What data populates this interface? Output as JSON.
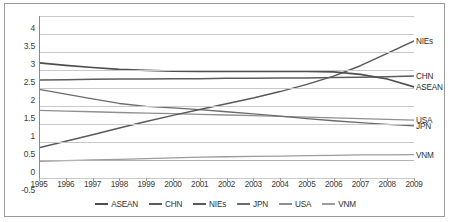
{
  "chart_data": {
    "type": "line",
    "title": "",
    "subtitle": "",
    "xlabel": "",
    "ylabel": "",
    "x": [
      1995,
      1996,
      1997,
      1998,
      1999,
      2000,
      2001,
      2002,
      2003,
      2004,
      2005,
      2006,
      2007,
      2008,
      2009
    ],
    "xtick_labels": [
      "1995",
      "1996",
      "1997",
      "1998",
      "1999",
      "2000",
      "2001",
      "2002",
      "2003",
      "2004",
      "2005",
      "2006",
      "2007",
      "2008",
      "2009"
    ],
    "ytick_labels": [
      "-0.5",
      "0",
      "0.5",
      "1",
      "1.5",
      "2",
      "2.5",
      "3",
      "3.5",
      "4"
    ],
    "yticks": [
      -0.5,
      0,
      0.5,
      1,
      1.5,
      2,
      2.5,
      3,
      3.5,
      4
    ],
    "ylim": [
      -0.5,
      4
    ],
    "xlim": [
      1995,
      2009
    ],
    "grid": true,
    "legend_position": "bottom",
    "series": [
      {
        "name": "ASEAN",
        "color": "#6f6f6f",
        "end_label": "ASEAN",
        "values": [
          1.96,
          1.88,
          1.79,
          1.71,
          1.63,
          1.55,
          1.62,
          1.69,
          1.76,
          1.83,
          1.89,
          1.94,
          1.98,
          2.0,
          2.02
        ]
      },
      {
        "name": "CHN",
        "color": "#5e5e5e",
        "end_label": "CHN",
        "values": [
          2.22,
          2.23,
          2.24,
          2.25,
          2.26,
          2.27,
          2.27,
          2.28,
          2.28,
          2.29,
          2.29,
          2.3,
          2.31,
          2.32,
          2.33
        ]
      },
      {
        "name": "NIEs",
        "color": "#4a4a4a",
        "end_label": "NIEs",
        "values": [
          2.7,
          2.64,
          2.58,
          2.53,
          2.5,
          2.48,
          2.47,
          2.48,
          2.5,
          2.55,
          2.64,
          2.78,
          2.95,
          3.14,
          3.31
        ]
      },
      {
        "name": "JPN",
        "color": "#7a7a7a",
        "end_label": "JPN",
        "values": [
          1.38,
          1.35,
          1.32,
          1.29,
          1.26,
          1.23,
          1.21,
          1.18,
          1.15,
          1.12,
          1.09,
          1.06,
          1.02,
          0.98,
          0.95
        ]
      },
      {
        "name": "USA",
        "color": "#8c8c8c",
        "end_label": "USA",
        "values": [
          2.7,
          2.64,
          2.58,
          2.53,
          2.5,
          2.48,
          2.47,
          2.48,
          2.5,
          2.55,
          2.64,
          2.78,
          2.95,
          3.14,
          3.31
        ]
      },
      {
        "name": "VNM",
        "color": "#9a9a9a",
        "end_label": "VNM",
        "values": [
          -0.04,
          -0.02,
          0.0,
          0.02,
          0.04,
          0.06,
          0.08,
          0.09,
          0.1,
          0.11,
          0.12,
          0.13,
          0.14,
          0.145,
          0.15
        ]
      }
    ],
    "series_render": [
      {
        "name": "VNM",
        "color": "#9c9c9c",
        "width": 1.3,
        "values": [
          -0.04,
          -0.02,
          0.0,
          0.02,
          0.04,
          0.06,
          0.08,
          0.09,
          0.1,
          0.11,
          0.12,
          0.13,
          0.14,
          0.145,
          0.15
        ]
      },
      {
        "name": "USA",
        "color": "#8f8f8f",
        "width": 1.3,
        "values": [
          1.38,
          1.36,
          1.34,
          1.32,
          1.3,
          1.29,
          1.27,
          1.25,
          1.23,
          1.21,
          1.19,
          1.17,
          1.15,
          1.13,
          1.11
        ]
      },
      {
        "name": "JPN",
        "color": "#6b6b6b",
        "width": 1.3,
        "values": [
          1.96,
          1.83,
          1.7,
          1.57,
          1.49,
          1.45,
          1.4,
          1.34,
          1.28,
          1.22,
          1.15,
          1.09,
          1.04,
          0.99,
          0.95
        ]
      },
      {
        "name": "NIEs",
        "color": "#595959",
        "width": 1.5,
        "values": [
          0.34,
          0.52,
          0.7,
          0.89,
          1.07,
          1.24,
          1.4,
          1.56,
          1.72,
          1.9,
          2.1,
          2.33,
          2.62,
          2.96,
          3.31
        ]
      },
      {
        "name": "CHN",
        "color": "#5c5c5c",
        "width": 1.5,
        "values": [
          2.22,
          2.23,
          2.24,
          2.25,
          2.25,
          2.26,
          2.26,
          2.27,
          2.27,
          2.28,
          2.28,
          2.29,
          2.3,
          2.31,
          2.33
        ]
      },
      {
        "name": "ASEAN",
        "color": "#4e4e4e",
        "width": 1.7,
        "values": [
          2.7,
          2.63,
          2.57,
          2.52,
          2.49,
          2.47,
          2.46,
          2.46,
          2.46,
          2.46,
          2.46,
          2.45,
          2.38,
          2.25,
          2.03
        ]
      }
    ],
    "right_labels": [
      {
        "text": "NIEs",
        "value": 3.31
      },
      {
        "text": "CHN",
        "value": 2.33
      },
      {
        "text": "ASEAN",
        "value": 2.03
      },
      {
        "text": "USA",
        "value": 1.11
      },
      {
        "text": "JPN",
        "value": 0.95
      },
      {
        "text": "VNM",
        "value": 0.15
      }
    ],
    "legend": [
      {
        "label": "ASEAN",
        "color": "#4e4e4e"
      },
      {
        "label": "CHN",
        "color": "#5c5c5c"
      },
      {
        "label": "NIEs",
        "color": "#595959"
      },
      {
        "label": "JPN",
        "color": "#6b6b6b"
      },
      {
        "label": "USA",
        "color": "#8f8f8f"
      },
      {
        "label": "VNM",
        "color": "#9c9c9c"
      }
    ]
  }
}
